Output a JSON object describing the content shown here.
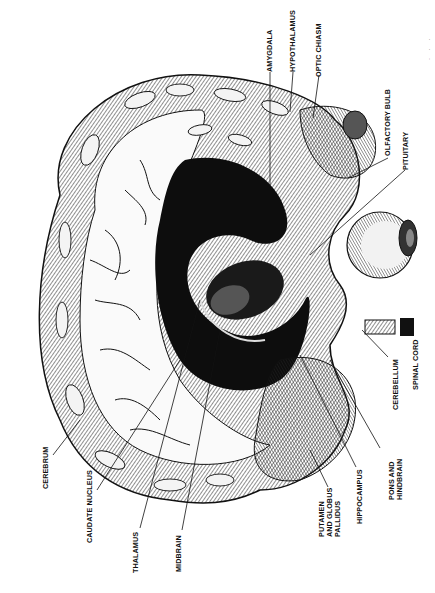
{
  "figure": {
    "orientation": "rotated counter-clockwise",
    "colors": {
      "ink": "#111111",
      "paper": "#ffffff",
      "shading": "#2a2a2a"
    }
  },
  "labels": {
    "amygdala": "AMYGDALA",
    "hypothalamus": "HYPOTHALAMUS",
    "optic_chiasm": "OPTIC CHIASM",
    "olfactory_bulb": "OLFACTORY BULB",
    "pituitary": "PITUITARY",
    "spinal_cord": "SPINAL CORD",
    "cerebellum": "CEREBELLUM",
    "pons_and_hindbrain": "PONS AND\nHINDBRAIN",
    "hippocampus": "HIPPOCAMPUS",
    "putamen_and_globus_pallidus": "PUTAMEN\nAND GLOBUS\nPALLIDUS",
    "midbrain": "MIDBRAIN",
    "thalamus": "THALAMUS",
    "caudate_nucleus": "CAUDATE NUCLEUS",
    "cerebrum": "CEREBRUM"
  },
  "edge_marks": "· · ·"
}
